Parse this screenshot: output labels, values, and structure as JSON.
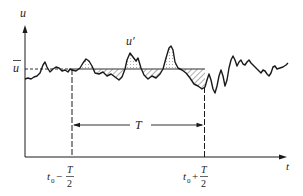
{
  "diagram": {
    "type": "time-averaging-of-turbulent-velocity",
    "axes": {
      "y_label": "u",
      "x_label": "t"
    },
    "mean_label": "u",
    "fluctuation_label": "u′",
    "interval_label": "T",
    "left_bound": {
      "prefix": "t",
      "subscript": "0",
      "op": "−",
      "numerator": "T",
      "denominator": "2"
    },
    "right_bound": {
      "prefix": "t",
      "subscript": "0",
      "op": "+",
      "numerator": "T",
      "denominator": "2"
    },
    "colors": {
      "line": "#1a1a1a",
      "hatch": "#333333",
      "dots": "#555555"
    }
  }
}
